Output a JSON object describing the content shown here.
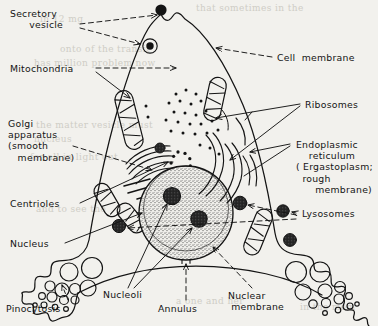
{
  "figure": {
    "kind": "labeled-diagram",
    "style": "hand-drawn ink line drawing, dashed leader lines with arrowheads",
    "paper_color": "#f2f1ed",
    "ink_color": "#141414"
  },
  "labels": {
    "secretory_vesicle": "Secretory\n      vesicle",
    "mitochondria": "Mitochondria",
    "golgi": "Golgi\napparatus\n(smooth\n   membrane)",
    "centrioles": "Centrioles",
    "nucleus": "Nucleus",
    "pinocytosis": "Pinocytosis",
    "nucleoli": "Nucleoli",
    "annulus": "Annulus",
    "nuclear_membrane": "Nuclear\n membrane",
    "cell_membrane": "Cell  membrane",
    "ribosomes": "Ribosomes",
    "endoplasmic_reticulum": "Endoplasmic\n    reticulum\n( Ergastoplasm;\n  rough\n      membrane)",
    "lysosomes": "Lysosomes"
  },
  "bleed_through": [
    {
      "text": "that sometimes in the",
      "x": 196,
      "y": 3
    },
    {
      "text": "in 12 mg",
      "x": 40,
      "y": 14
    },
    {
      "text": "onto of the transit",
      "x": 60,
      "y": 44
    },
    {
      "text": "has million problem now",
      "x": 34,
      "y": 58
    },
    {
      "text": "the matter vesicle must",
      "x": 36,
      "y": 120
    },
    {
      "text": "nucleus",
      "x": 34,
      "y": 134
    },
    {
      "text": "for all in light out",
      "x": 30,
      "y": 152
    },
    {
      "text": "and to see the",
      "x": 36,
      "y": 204
    },
    {
      "text": "a one and her",
      "x": 176,
      "y": 296
    },
    {
      "text": "in the mem",
      "x": 300,
      "y": 302
    }
  ],
  "structures": [
    {
      "name": "cell-membrane",
      "count": 1
    },
    {
      "name": "secretory-vesicle-exocytosing",
      "count": 1
    },
    {
      "name": "secretory-vesicle-internal",
      "count": 1
    },
    {
      "name": "mitochondrion",
      "count": 5
    },
    {
      "name": "golgi-apparatus",
      "count": 1
    },
    {
      "name": "centriole",
      "count": 1
    },
    {
      "name": "nucleus",
      "count": 1
    },
    {
      "name": "nucleolus",
      "count": 2
    },
    {
      "name": "nuclear-membrane",
      "count": 1
    },
    {
      "name": "annulus",
      "count": 1
    },
    {
      "name": "endoplasmic-reticulum-cisterna",
      "count": 7
    },
    {
      "name": "ribosome",
      "count": 26
    },
    {
      "name": "lysosome",
      "count": 4
    },
    {
      "name": "pinocytotic-vesicle",
      "count": 20
    }
  ]
}
